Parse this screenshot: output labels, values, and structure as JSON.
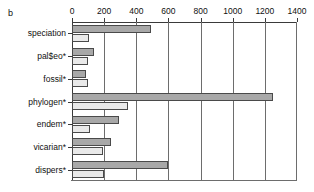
{
  "panel": {
    "label": "b"
  },
  "chart_data": {
    "type": "bar",
    "orientation": "horizontal",
    "title": "",
    "xlabel": "",
    "ylabel": "",
    "xlim": [
      0,
      1400
    ],
    "xticks": [
      0,
      200,
      400,
      600,
      800,
      1000,
      1200,
      1400
    ],
    "xticklabels": [
      "0",
      "200",
      "400",
      "600",
      "800",
      "1000",
      "1200",
      "1400"
    ],
    "grid": true,
    "legend": "none",
    "categories": [
      "speciation",
      "pal$eo*",
      "fossil*",
      "phylogen*",
      "endem*",
      "vicarian*",
      "dispers*"
    ],
    "series": [
      {
        "name": "dark",
        "color": "#a8a8a8",
        "values": [
          490,
          135,
          90,
          1250,
          290,
          240,
          600
        ]
      },
      {
        "name": "light",
        "color": "#e9e9e9",
        "values": [
          105,
          100,
          100,
          350,
          110,
          190,
          200
        ]
      }
    ]
  }
}
